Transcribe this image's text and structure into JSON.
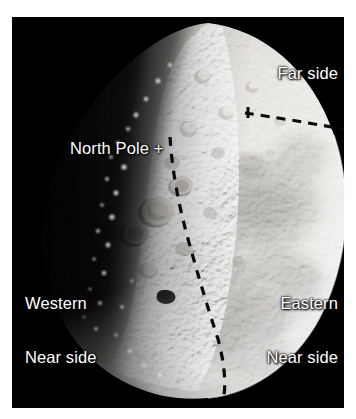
{
  "figure": {
    "kind": "annotated-photograph",
    "background_color": "#ffffff",
    "plate_color": "#000000",
    "label_color": "#ffffff"
  },
  "labels": {
    "far_side": "Far side",
    "north_pole": "North Pole +",
    "north_pole_text": "North Pole",
    "north_pole_marker": "+",
    "western_line1": "Western",
    "western_line2": "Near side",
    "eastern_line1": "Eastern",
    "eastern_line2": "Near side"
  },
  "annotations": {
    "equator_dashed_line": "dashed-line-equator",
    "limb_dashed_line": "dashed-line-near-far-boundary",
    "marker_plus": "+"
  }
}
